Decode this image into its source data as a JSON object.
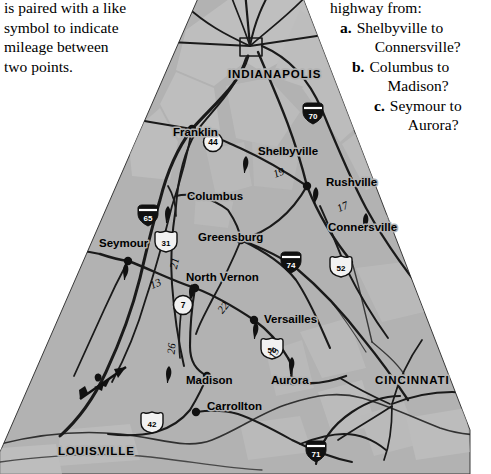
{
  "intro": {
    "lines": [
      "is paired with a like",
      "symbol to indicate",
      "mileage between",
      "two points."
    ]
  },
  "questions": {
    "lead": "highway from:",
    "items": [
      {
        "label": "a.",
        "line1": "Shelbyville to",
        "line2": "Connersville?"
      },
      {
        "label": "b.",
        "line1": "Columbus to",
        "line2": "Madison?"
      },
      {
        "label": "c.",
        "line1": "Seymour to",
        "line2": "Aurora?"
      }
    ]
  },
  "map": {
    "colors": {
      "land": "#b2b2b2",
      "urban": "#c4c4c4",
      "road": "#1a1a1a",
      "page": "#ffffff"
    },
    "major_cities": [
      {
        "name": "INDIANAPOLIS",
        "x": 228,
        "y": 78
      },
      {
        "name": "CINCINNATI",
        "x": 375,
        "y": 384
      },
      {
        "name": "LOUISVILLE",
        "x": 58,
        "y": 455
      }
    ],
    "cities": [
      {
        "name": "Franklin",
        "x": 173,
        "y": 136
      },
      {
        "name": "Shelbyville",
        "x": 258,
        "y": 155
      },
      {
        "name": "Rushville",
        "x": 326,
        "y": 186
      },
      {
        "name": "Columbus",
        "x": 187,
        "y": 200
      },
      {
        "name": "Greensburg",
        "x": 198,
        "y": 241
      },
      {
        "name": "Connersville",
        "x": 328,
        "y": 231
      },
      {
        "name": "Seymour",
        "x": 99,
        "y": 247
      },
      {
        "name": "North Vernon",
        "x": 186,
        "y": 281
      },
      {
        "name": "Versailles",
        "x": 264,
        "y": 323
      },
      {
        "name": "Madison",
        "x": 186,
        "y": 384
      },
      {
        "name": "Aurora",
        "x": 271,
        "y": 384
      },
      {
        "name": "Carrollton",
        "x": 207,
        "y": 410
      }
    ],
    "mileages": [
      {
        "value": "19",
        "x": 280,
        "y": 176
      },
      {
        "value": "17",
        "x": 344,
        "y": 210
      },
      {
        "value": "21",
        "x": 178,
        "y": 264
      },
      {
        "value": "13",
        "x": 157,
        "y": 287
      },
      {
        "value": "22",
        "x": 226,
        "y": 310
      },
      {
        "value": "26",
        "x": 175,
        "y": 349
      },
      {
        "value": "15",
        "x": 277,
        "y": 355
      }
    ],
    "route_shields": [
      {
        "type": "interstate",
        "number": "70",
        "x": 313,
        "y": 114
      },
      {
        "type": "interstate",
        "number": "65",
        "x": 148,
        "y": 216
      },
      {
        "type": "interstate",
        "number": "74",
        "x": 291,
        "y": 263
      },
      {
        "type": "interstate",
        "number": "71",
        "x": 316,
        "y": 452
      },
      {
        "type": "us",
        "number": "31",
        "x": 166,
        "y": 242
      },
      {
        "type": "us",
        "number": "52",
        "x": 341,
        "y": 267
      },
      {
        "type": "us",
        "number": "50",
        "x": 272,
        "y": 349
      },
      {
        "type": "us",
        "number": "42",
        "x": 152,
        "y": 423
      },
      {
        "type": "state",
        "number": "44",
        "x": 213,
        "y": 142
      },
      {
        "type": "state",
        "number": "7",
        "x": 183,
        "y": 305
      }
    ],
    "city_dots": [
      {
        "x": 192,
        "y": 129
      },
      {
        "x": 307,
        "y": 186
      },
      {
        "x": 241,
        "y": 240
      },
      {
        "x": 128,
        "y": 261
      },
      {
        "x": 195,
        "y": 288
      },
      {
        "x": 254,
        "y": 320
      },
      {
        "x": 207,
        "y": 376
      },
      {
        "x": 293,
        "y": 381
      },
      {
        "x": 196,
        "y": 412
      }
    ],
    "pair_symbols": [
      {
        "kind": "flag",
        "x": 246,
        "y": 165
      },
      {
        "kind": "flag",
        "x": 316,
        "y": 196
      },
      {
        "kind": "flag",
        "x": 168,
        "y": 215
      },
      {
        "kind": "flag",
        "x": 366,
        "y": 222
      },
      {
        "kind": "flag",
        "x": 126,
        "y": 272
      },
      {
        "kind": "flag",
        "x": 192,
        "y": 293
      },
      {
        "kind": "flag",
        "x": 256,
        "y": 331
      },
      {
        "kind": "flag",
        "x": 292,
        "y": 366
      },
      {
        "kind": "flag",
        "x": 169,
        "y": 375
      }
    ],
    "compass": {
      "label": "north-arrow",
      "x": 104,
      "y": 381
    }
  }
}
